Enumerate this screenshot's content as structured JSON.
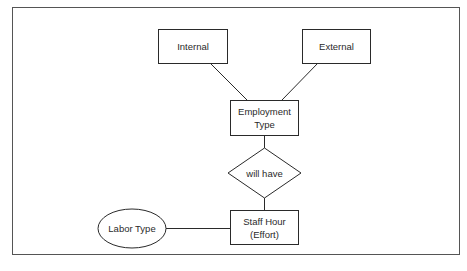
{
  "diagram": {
    "type": "entity-relationship",
    "nodes": {
      "internal": {
        "label": "Internal",
        "shape": "rectangle"
      },
      "external": {
        "label": "External",
        "shape": "rectangle"
      },
      "employment_type": {
        "line1": "Employment",
        "line2": "Type",
        "shape": "rectangle"
      },
      "will_have": {
        "label": "will have",
        "shape": "diamond"
      },
      "staff_hour": {
        "line1": "Staff Hour",
        "line2": "(Effort)",
        "shape": "rectangle"
      },
      "labor_type": {
        "label": "Labor Type",
        "shape": "ellipse"
      }
    },
    "edges": [
      {
        "from": "internal",
        "to": "employment_type"
      },
      {
        "from": "external",
        "to": "employment_type"
      },
      {
        "from": "employment_type",
        "to": "will_have"
      },
      {
        "from": "will_have",
        "to": "staff_hour"
      },
      {
        "from": "labor_type",
        "to": "staff_hour"
      }
    ],
    "colors": {
      "stroke": "#2a2a2a",
      "background": "#ffffff",
      "frame": "#555555"
    }
  }
}
